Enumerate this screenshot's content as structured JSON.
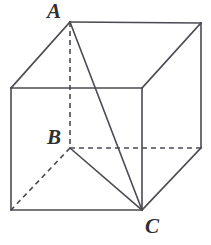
{
  "figure": {
    "name": "cube-with-inscribed-triangle",
    "background_color": "#ffffff",
    "line_color": "#4a4a52",
    "label_color": "#2f2f33",
    "solid_stroke_width": 1.6,
    "dashed_stroke_width": 1.6,
    "dash_pattern": "5,4",
    "canvas": {
      "width": 211,
      "height": 245
    }
  },
  "labels": [
    {
      "id": "A",
      "text": "A",
      "x": 47,
      "y": 1
    },
    {
      "id": "B",
      "text": "B",
      "x": 47,
      "y": 127
    },
    {
      "id": "C",
      "text": "C",
      "x": 145,
      "y": 216
    }
  ],
  "points": {
    "A": {
      "x": 70,
      "y": 22,
      "role": "top-back-left"
    },
    "B": {
      "x": 70,
      "y": 148,
      "role": "bottom-back-left"
    },
    "C": {
      "x": 142,
      "y": 210,
      "role": "bottom-front-right"
    },
    "top_back_right": {
      "x": 201,
      "y": 23
    },
    "top_front_left": {
      "x": 11,
      "y": 88
    },
    "top_front_right": {
      "x": 142,
      "y": 88
    },
    "bottom_back_right": {
      "x": 201,
      "y": 148
    },
    "bottom_front_left": {
      "x": 11,
      "y": 210
    }
  },
  "edges": {
    "solid": [
      {
        "name": "top-back-edge",
        "x1": 70,
        "y1": 22,
        "x2": 201,
        "y2": 23
      },
      {
        "name": "top-left-diagonal-edge",
        "x1": 70,
        "y1": 22,
        "x2": 11,
        "y2": 88
      },
      {
        "name": "top-right-diagonal-edge",
        "x1": 201,
        "y1": 23,
        "x2": 142,
        "y2": 88
      },
      {
        "name": "top-front-edge",
        "x1": 11,
        "y1": 88,
        "x2": 142,
        "y2": 88
      },
      {
        "name": "front-left-vertical-edge",
        "x1": 11,
        "y1": 88,
        "x2": 11,
        "y2": 210
      },
      {
        "name": "front-right-vertical-edge",
        "x1": 142,
        "y1": 88,
        "x2": 142,
        "y2": 210
      },
      {
        "name": "back-right-vertical-edge",
        "x1": 201,
        "y1": 23,
        "x2": 201,
        "y2": 148
      },
      {
        "name": "bottom-front-edge",
        "x1": 11,
        "y1": 210,
        "x2": 142,
        "y2": 210
      },
      {
        "name": "bottom-right-diagonal-edge",
        "x1": 201,
        "y1": 148,
        "x2": 142,
        "y2": 210
      }
    ],
    "dashed": [
      {
        "name": "back-left-vertical-edge",
        "x1": 70,
        "y1": 22,
        "x2": 70,
        "y2": 148
      },
      {
        "name": "bottom-back-edge",
        "x1": 70,
        "y1": 148,
        "x2": 201,
        "y2": 148
      },
      {
        "name": "bottom-left-diagonal-edge",
        "x1": 70,
        "y1": 148,
        "x2": 11,
        "y2": 210
      }
    ]
  },
  "triangle_segments": [
    {
      "name": "segment-A-C",
      "from": "A",
      "to": "C",
      "x1": 70,
      "y1": 22,
      "x2": 142,
      "y2": 210,
      "style": "solid"
    },
    {
      "name": "segment-B-C",
      "from": "B",
      "to": "C",
      "x1": 70,
      "y1": 148,
      "x2": 142,
      "y2": 210,
      "style": "solid"
    },
    {
      "name": "segment-A-B",
      "from": "A",
      "to": "B",
      "x1": 70,
      "y1": 22,
      "x2": 70,
      "y2": 148,
      "style": "dashed"
    }
  ]
}
